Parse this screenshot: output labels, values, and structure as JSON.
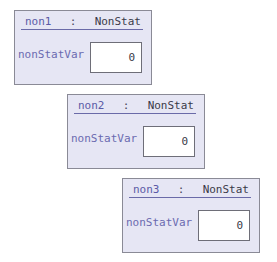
{
  "objects": [
    {
      "name": "non1",
      "separator": ":",
      "class": "NonStat",
      "field": {
        "label": "nonStatVar",
        "value": "0"
      }
    },
    {
      "name": "non2",
      "separator": ":",
      "class": "NonStat",
      "field": {
        "label": "nonStatVar",
        "value": "0"
      }
    },
    {
      "name": "non3",
      "separator": ":",
      "class": "NonStat",
      "field": {
        "label": "nonStatVar",
        "value": "0"
      }
    }
  ],
  "colors": {
    "box_background": "#e6e6f4",
    "box_border": "#8a8a96",
    "object_name": "#5a5aa6",
    "class_name": "#3a3a48",
    "field_label": "#6a6ab0",
    "value_background": "#ffffff"
  }
}
